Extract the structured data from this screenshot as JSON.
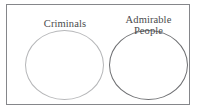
{
  "diagram": {
    "type": "venn-disjoint-sets",
    "frame": {
      "name": "universal-set-box",
      "border_color": "#85868a"
    },
    "background_color": "#ffffff",
    "sets": [
      {
        "id": "criminals",
        "label": "Criminals",
        "label_lines": "Criminals",
        "stroke_color": "#b6b7b9",
        "fill": "none",
        "position": "left"
      },
      {
        "id": "admirable-people",
        "label": "Admirable People",
        "label_lines": "Admirable\nPeople",
        "stroke_color": "#6f7073",
        "fill": "none",
        "position": "right"
      }
    ],
    "text_color": "#4a4a4c",
    "overlap": "none"
  }
}
